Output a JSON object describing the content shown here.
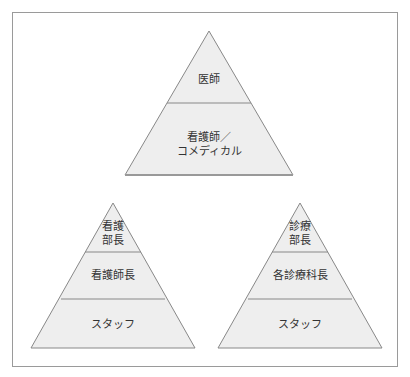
{
  "diagram": {
    "top_pyramid": {
      "name": "overall",
      "levels": [
        {
          "label": "医師"
        },
        {
          "label": "看護師／\nコメディカル"
        }
      ]
    },
    "left_pyramid": {
      "name": "nursing",
      "levels": [
        {
          "label": "看護\n部長"
        },
        {
          "label": "看護師長"
        },
        {
          "label": "スタッフ"
        }
      ]
    },
    "right_pyramid": {
      "name": "medical",
      "levels": [
        {
          "label": "診療\n部長"
        },
        {
          "label": "各診療科長"
        },
        {
          "label": "スタッフ"
        }
      ]
    },
    "colors": {
      "fill": "#eeeeee",
      "stroke": "#888888",
      "frame": "#9a9a9a",
      "text": "#333333"
    }
  }
}
